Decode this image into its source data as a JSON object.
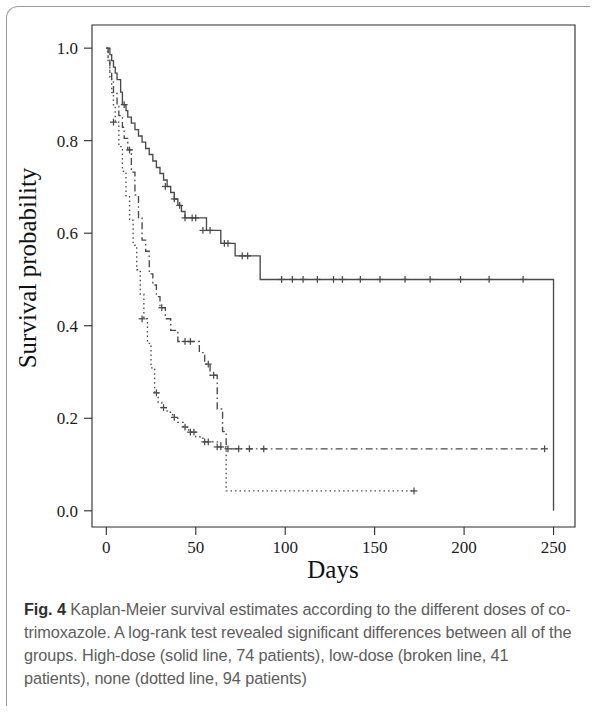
{
  "figure": {
    "caption_label": "Fig. 4",
    "caption_text": "Kaplan-Meier survival estimates according to the different doses of co-trimoxazole. A log-rank test revealed significant differences between all of the groups. High-dose (solid line, 74 patients), low-dose (broken line, 41 patients), none (dotted line, 94 patients)"
  },
  "chart_data": {
    "type": "line",
    "plot_kind": "kaplan-meier-step",
    "title": "",
    "xlabel": "Days",
    "ylabel": "Survival probability",
    "xlim": [
      -8,
      262
    ],
    "ylim": [
      -0.035,
      1.05
    ],
    "xticks": [
      0,
      50,
      100,
      150,
      200,
      250
    ],
    "xtick_labels": [
      "0",
      "50",
      "100",
      "150",
      "200",
      "250"
    ],
    "yticks": [
      0.0,
      0.2,
      0.4,
      0.6,
      0.8,
      1.0
    ],
    "ytick_labels": [
      "0.0",
      "0.2",
      "0.4",
      "0.6",
      "0.8",
      "1.0"
    ],
    "grid": false,
    "legend": "none (described in caption)",
    "line_color": "#4a4a4a",
    "series": [
      {
        "name": "High-dose",
        "style": "solid",
        "patients": 74,
        "steps": [
          [
            0,
            1.0
          ],
          [
            2,
            0.986
          ],
          [
            3,
            0.973
          ],
          [
            4,
            0.959
          ],
          [
            5,
            0.946
          ],
          [
            6,
            0.932
          ],
          [
            8,
            0.905
          ],
          [
            9,
            0.878
          ],
          [
            11,
            0.865
          ],
          [
            12,
            0.851
          ],
          [
            14,
            0.838
          ],
          [
            16,
            0.824
          ],
          [
            18,
            0.81
          ],
          [
            20,
            0.797
          ],
          [
            22,
            0.783
          ],
          [
            24,
            0.77
          ],
          [
            26,
            0.756
          ],
          [
            28,
            0.742
          ],
          [
            30,
            0.729
          ],
          [
            32,
            0.715
          ],
          [
            34,
            0.701
          ],
          [
            36,
            0.688
          ],
          [
            38,
            0.674
          ],
          [
            40,
            0.66
          ],
          [
            42,
            0.647
          ],
          [
            44,
            0.633
          ],
          [
            52,
            0.633
          ],
          [
            56,
            0.606
          ],
          [
            62,
            0.606
          ],
          [
            64,
            0.578
          ],
          [
            70,
            0.578
          ],
          [
            72,
            0.551
          ],
          [
            82,
            0.551
          ],
          [
            86,
            0.5
          ],
          [
            96,
            0.5
          ],
          [
            250,
            0.5
          ],
          [
            250,
            0.0
          ]
        ],
        "censored": [
          [
            10,
            0.878
          ],
          [
            33,
            0.701
          ],
          [
            38,
            0.674
          ],
          [
            41,
            0.66
          ],
          [
            44,
            0.633
          ],
          [
            48,
            0.633
          ],
          [
            50,
            0.633
          ],
          [
            54,
            0.606
          ],
          [
            58,
            0.606
          ],
          [
            66,
            0.578
          ],
          [
            68,
            0.578
          ],
          [
            76,
            0.551
          ],
          [
            79,
            0.551
          ],
          [
            98,
            0.5
          ],
          [
            104,
            0.5
          ],
          [
            110,
            0.5
          ],
          [
            118,
            0.5
          ],
          [
            127,
            0.5
          ],
          [
            132,
            0.5
          ],
          [
            142,
            0.5
          ],
          [
            153,
            0.5
          ],
          [
            167,
            0.5
          ],
          [
            181,
            0.5
          ],
          [
            198,
            0.5
          ],
          [
            214,
            0.5
          ],
          [
            233,
            0.5
          ]
        ]
      },
      {
        "name": "Low-dose",
        "style": "broken",
        "patients": 41,
        "steps": [
          [
            0,
            1.0
          ],
          [
            1,
            0.976
          ],
          [
            2,
            0.951
          ],
          [
            3,
            0.927
          ],
          [
            4,
            0.902
          ],
          [
            6,
            0.878
          ],
          [
            7,
            0.854
          ],
          [
            9,
            0.829
          ],
          [
            10,
            0.805
          ],
          [
            12,
            0.78
          ],
          [
            14,
            0.732
          ],
          [
            16,
            0.683
          ],
          [
            18,
            0.634
          ],
          [
            20,
            0.585
          ],
          [
            22,
            0.561
          ],
          [
            24,
            0.512
          ],
          [
            26,
            0.488
          ],
          [
            28,
            0.463
          ],
          [
            30,
            0.439
          ],
          [
            33,
            0.415
          ],
          [
            36,
            0.39
          ],
          [
            40,
            0.366
          ],
          [
            49,
            0.366
          ],
          [
            52,
            0.342
          ],
          [
            55,
            0.317
          ],
          [
            58,
            0.293
          ],
          [
            62,
            0.22
          ],
          [
            65,
            0.171
          ],
          [
            67,
            0.134
          ],
          [
            245,
            0.134
          ]
        ],
        "censored": [
          [
            13,
            0.78
          ],
          [
            31,
            0.439
          ],
          [
            44,
            0.366
          ],
          [
            47,
            0.366
          ],
          [
            57,
            0.317
          ],
          [
            60,
            0.293
          ],
          [
            68,
            0.134
          ],
          [
            74,
            0.134
          ],
          [
            80,
            0.134
          ],
          [
            88,
            0.134
          ],
          [
            245,
            0.134
          ]
        ]
      },
      {
        "name": "None",
        "style": "dotted",
        "patients": 94,
        "steps": [
          [
            0,
            1.0
          ],
          [
            1,
            0.968
          ],
          [
            2,
            0.936
          ],
          [
            3,
            0.904
          ],
          [
            4,
            0.872
          ],
          [
            5,
            0.84
          ],
          [
            7,
            0.787
          ],
          [
            9,
            0.734
          ],
          [
            11,
            0.681
          ],
          [
            13,
            0.628
          ],
          [
            15,
            0.574
          ],
          [
            17,
            0.521
          ],
          [
            19,
            0.468
          ],
          [
            21,
            0.415
          ],
          [
            23,
            0.362
          ],
          [
            25,
            0.309
          ],
          [
            27,
            0.255
          ],
          [
            29,
            0.234
          ],
          [
            31,
            0.223
          ],
          [
            34,
            0.213
          ],
          [
            37,
            0.202
          ],
          [
            40,
            0.191
          ],
          [
            43,
            0.181
          ],
          [
            46,
            0.17
          ],
          [
            50,
            0.16
          ],
          [
            54,
            0.149
          ],
          [
            58,
            0.149
          ],
          [
            64,
            0.138
          ],
          [
            67,
            0.138
          ],
          [
            67,
            0.043
          ],
          [
            172,
            0.043
          ]
        ],
        "censored": [
          [
            4,
            0.84
          ],
          [
            20,
            0.415
          ],
          [
            28,
            0.255
          ],
          [
            32,
            0.223
          ],
          [
            38,
            0.202
          ],
          [
            44,
            0.181
          ],
          [
            47,
            0.17
          ],
          [
            49,
            0.17
          ],
          [
            55,
            0.149
          ],
          [
            57,
            0.149
          ],
          [
            62,
            0.138
          ],
          [
            64,
            0.138
          ],
          [
            172,
            0.043
          ]
        ]
      }
    ]
  }
}
